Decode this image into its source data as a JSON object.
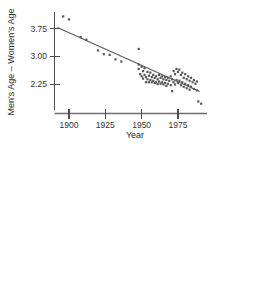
{
  "figure": {
    "background": "#ffffff",
    "point_color": "#555555",
    "line_color": "#5a5a5a",
    "axis_color": "#4d4d4d"
  },
  "chart_data": [
    {
      "type": "scatter",
      "title": "",
      "xlabel": "Year",
      "ylabel": "Men's Age – Women's Age",
      "xlim": [
        1890,
        1995
      ],
      "ylim": [
        1.55,
        4.2
      ],
      "xticks": [
        1900,
        1925,
        1950,
        1975
      ],
      "xticklabels": [
        "1900",
        "1925",
        "1950",
        "1975"
      ],
      "yticks": [
        2.25,
        3.0,
        3.75
      ],
      "yticklabels": [
        "2.25",
        "3.00",
        "3.75"
      ],
      "grid": false,
      "legend": null,
      "trendline": {
        "type": "linear-fit",
        "x": [
          1892,
          1990
        ],
        "y": [
          3.78,
          2.05
        ]
      },
      "points": [
        [
          1896,
          4.08
        ],
        [
          1900,
          4.0
        ],
        [
          1908,
          3.52
        ],
        [
          1912,
          3.45
        ],
        [
          1920,
          3.16
        ],
        [
          1924,
          3.06
        ],
        [
          1928,
          3.04
        ],
        [
          1932,
          2.92
        ],
        [
          1936,
          2.86
        ],
        [
          1948,
          3.2
        ],
        [
          1948,
          2.78
        ],
        [
          1948,
          2.66
        ],
        [
          1949,
          2.52
        ],
        [
          1950,
          2.72
        ],
        [
          1950,
          2.46
        ],
        [
          1951,
          2.6
        ],
        [
          1951,
          2.4
        ],
        [
          1952,
          2.68
        ],
        [
          1952,
          2.5
        ],
        [
          1953,
          2.44
        ],
        [
          1953,
          2.3
        ],
        [
          1954,
          2.58
        ],
        [
          1954,
          2.38
        ],
        [
          1955,
          2.48
        ],
        [
          1955,
          2.3
        ],
        [
          1956,
          2.56
        ],
        [
          1956,
          2.36
        ],
        [
          1957,
          2.44
        ],
        [
          1957,
          2.3
        ],
        [
          1958,
          2.5
        ],
        [
          1958,
          2.34
        ],
        [
          1959,
          2.42
        ],
        [
          1959,
          2.28
        ],
        [
          1960,
          2.46
        ],
        [
          1960,
          2.3
        ],
        [
          1961,
          2.38
        ],
        [
          1961,
          2.25
        ],
        [
          1962,
          2.5
        ],
        [
          1962,
          2.32
        ],
        [
          1963,
          2.42
        ],
        [
          1963,
          2.26
        ],
        [
          1964,
          2.46
        ],
        [
          1964,
          2.3
        ],
        [
          1965,
          2.38
        ],
        [
          1965,
          2.24
        ],
        [
          1966,
          2.44
        ],
        [
          1966,
          2.28
        ],
        [
          1967,
          2.36
        ],
        [
          1967,
          2.2
        ],
        [
          1968,
          2.42
        ],
        [
          1968,
          2.26
        ],
        [
          1969,
          2.34
        ],
        [
          1970,
          2.46
        ],
        [
          1970,
          2.22
        ],
        [
          1971,
          2.38
        ],
        [
          1971,
          2.06
        ],
        [
          1972,
          2.6
        ],
        [
          1972,
          2.3
        ],
        [
          1973,
          2.52
        ],
        [
          1973,
          2.24
        ],
        [
          1974,
          2.66
        ],
        [
          1974,
          2.36
        ],
        [
          1975,
          2.58
        ],
        [
          1975,
          2.28
        ],
        [
          1976,
          2.64
        ],
        [
          1976,
          2.34
        ],
        [
          1977,
          2.5
        ],
        [
          1977,
          2.22
        ],
        [
          1978,
          2.56
        ],
        [
          1978,
          2.3
        ],
        [
          1979,
          2.42
        ],
        [
          1979,
          2.18
        ],
        [
          1980,
          2.52
        ],
        [
          1980,
          2.26
        ],
        [
          1981,
          2.38
        ],
        [
          1981,
          2.14
        ],
        [
          1982,
          2.46
        ],
        [
          1982,
          2.22
        ],
        [
          1983,
          2.34
        ],
        [
          1983,
          2.1
        ],
        [
          1984,
          2.42
        ],
        [
          1984,
          2.18
        ],
        [
          1985,
          2.3
        ],
        [
          1986,
          2.36
        ],
        [
          1986,
          2.12
        ],
        [
          1987,
          2.26
        ],
        [
          1988,
          2.32
        ],
        [
          1988,
          2.08
        ],
        [
          1989,
          1.78
        ],
        [
          1991,
          1.72
        ]
      ]
    },
    {
      "type": "scatter",
      "title": "",
      "xlabel": "Predicted Values",
      "ylabel": "Residuals",
      "xlim": [
        2.08,
        3.78
      ],
      "ylim": [
        -0.42,
        0.54
      ],
      "xticks": [
        2.4,
        2.8,
        3.2,
        3.6
      ],
      "xticklabels": [
        "2.4",
        "2.8",
        "3.2",
        "3.6"
      ],
      "yticks": [
        -0.2,
        0.0,
        0.2,
        0.4
      ],
      "yticklabels": [
        "−0.2",
        "0.0",
        "0.2",
        "0.4"
      ],
      "grid": false,
      "legend": null,
      "zeroline": {
        "y": 0.02
      },
      "points": [
        [
          2.11,
          0.4
        ],
        [
          2.11,
          -0.23
        ],
        [
          2.12,
          -0.31
        ],
        [
          2.14,
          0.28
        ],
        [
          2.15,
          0.36
        ],
        [
          2.16,
          0.18
        ],
        [
          2.17,
          0.02
        ],
        [
          2.18,
          -0.07
        ],
        [
          2.19,
          0.22
        ],
        [
          2.2,
          0.1
        ],
        [
          2.21,
          0.0
        ],
        [
          2.22,
          -0.18
        ],
        [
          2.23,
          0.3
        ],
        [
          2.24,
          0.14
        ],
        [
          2.25,
          0.04
        ],
        [
          2.26,
          -0.02
        ],
        [
          2.27,
          0.42
        ],
        [
          2.28,
          0.2
        ],
        [
          2.29,
          0.08
        ],
        [
          2.3,
          -0.01
        ],
        [
          2.31,
          0.45
        ],
        [
          2.32,
          0.24
        ],
        [
          2.33,
          0.06
        ],
        [
          2.34,
          -0.05
        ],
        [
          2.35,
          0.41
        ],
        [
          2.36,
          0.16
        ],
        [
          2.37,
          0.02
        ],
        [
          2.38,
          -0.2
        ],
        [
          2.39,
          0.12
        ],
        [
          2.4,
          0.0
        ],
        [
          2.41,
          -0.1
        ],
        [
          2.42,
          -0.34
        ],
        [
          2.43,
          0.1
        ],
        [
          2.44,
          -0.04
        ],
        [
          2.45,
          -0.16
        ],
        [
          2.46,
          -0.24
        ],
        [
          2.47,
          0.04
        ],
        [
          2.48,
          -0.09
        ],
        [
          2.49,
          -0.22
        ],
        [
          2.5,
          -0.27
        ],
        [
          2.52,
          0.12
        ],
        [
          2.53,
          -0.03
        ],
        [
          2.54,
          -0.15
        ],
        [
          2.55,
          -0.25
        ],
        [
          2.56,
          -0.3
        ],
        [
          2.58,
          0.0
        ],
        [
          2.59,
          -0.12
        ],
        [
          2.6,
          -0.2
        ],
        [
          2.61,
          -0.28
        ],
        [
          2.62,
          -0.32
        ],
        [
          2.64,
          0.08
        ],
        [
          2.65,
          -0.06
        ],
        [
          2.66,
          -0.18
        ],
        [
          2.67,
          -0.26
        ],
        [
          2.68,
          0.02
        ],
        [
          2.7,
          -0.13
        ],
        [
          2.72,
          -0.21
        ],
        [
          2.74,
          0.14
        ],
        [
          2.76,
          -0.09
        ],
        [
          2.78,
          -0.3
        ],
        [
          2.79,
          0.41
        ],
        [
          2.82,
          -0.17
        ],
        [
          2.9,
          -0.1
        ],
        [
          3.08,
          -0.06
        ],
        [
          3.0,
          0.12
        ],
        [
          3.22,
          0.18
        ],
        [
          3.4,
          0.13
        ],
        [
          3.56,
          0.47
        ],
        [
          3.7,
          0.42
        ]
      ]
    }
  ]
}
